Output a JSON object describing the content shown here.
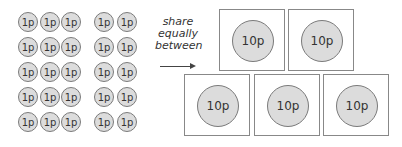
{
  "coins": {
    "label": "1p",
    "rows": 5,
    "cols": 5,
    "count": 25
  },
  "instruction": {
    "line1": "share",
    "line2": "equally",
    "line3": "between"
  },
  "boxes": [
    {
      "label": "10p"
    },
    {
      "label": "10p"
    },
    {
      "label": "10p"
    },
    {
      "label": "10p"
    },
    {
      "label": "10p"
    }
  ],
  "colors": {
    "coin_fill": "#dcdcdc",
    "coin_border": "#7a7a7a",
    "box_border": "#888888"
  }
}
